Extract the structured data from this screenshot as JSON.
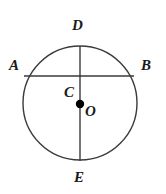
{
  "figure": {
    "type": "geometry-diagram",
    "background_color": "#ffffff",
    "stroke_color": "#3a3a3a",
    "label_color": "#1a1a1a",
    "dot_color": "#000000",
    "circle": {
      "center_x": 80,
      "center_y": 103,
      "radius": 57,
      "stroke_width": 1.4,
      "fill": "none"
    },
    "segments": [
      {
        "name": "diameter-DE",
        "x1": 80,
        "y1": 46,
        "x2": 80,
        "y2": 161,
        "stroke_width": 1.4
      },
      {
        "name": "chord-AB",
        "x1": 24,
        "y1": 76,
        "x2": 134,
        "y2": 76,
        "stroke_width": 1.4
      }
    ],
    "points": [
      {
        "name": "O",
        "cx": 80,
        "cy": 104,
        "r": 4.2,
        "filled": true
      }
    ],
    "labels": [
      {
        "id": "D",
        "text": "D",
        "x": 72,
        "y": 18
      },
      {
        "id": "A",
        "text": "A",
        "x": 9,
        "y": 58
      },
      {
        "id": "B",
        "text": "B",
        "x": 141,
        "y": 58
      },
      {
        "id": "C",
        "text": "C",
        "x": 64,
        "y": 85
      },
      {
        "id": "O",
        "text": "O",
        "x": 85,
        "y": 104
      },
      {
        "id": "E",
        "text": "E",
        "x": 74,
        "y": 170
      }
    ]
  }
}
